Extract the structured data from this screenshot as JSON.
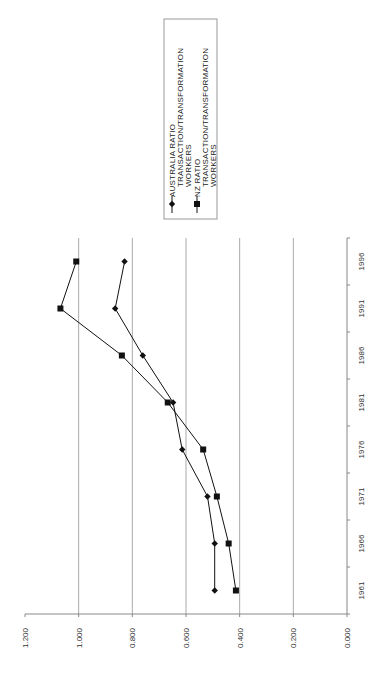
{
  "chart_data": {
    "type": "line",
    "orientation": "rotated-90-ccw",
    "title": "",
    "xlabel": "",
    "ylabel": "",
    "categories": [
      "1961",
      "1966",
      "1971",
      "1976",
      "1981",
      "1986",
      "1991",
      "1996"
    ],
    "series": [
      {
        "name": "AUSTRALIA RATIO TRANSACTION/TRANSFORMATION WORKERS",
        "legend_lines": [
          "AUSTRALIA RATIO",
          "TRANSACTION/TRANSFORMATION",
          "WORKERS"
        ],
        "marker": "diamond",
        "color": "#111111",
        "values": [
          0.493,
          0.493,
          0.52,
          0.614,
          0.648,
          0.761,
          0.864,
          0.829
        ]
      },
      {
        "name": "NZ RATIO TRANSACTION/TRANSFORMATION WORKERS",
        "legend_lines": [
          "NZ RATIO",
          "TRANSACTION/TRANSFORMATION",
          "WORKERS"
        ],
        "marker": "square",
        "color": "#111111",
        "values": [
          0.414,
          0.441,
          0.485,
          0.536,
          0.668,
          0.839,
          1.068,
          1.009
        ]
      }
    ],
    "ylim": [
      0,
      1.2
    ],
    "yticks": [
      "0.000",
      "0.200",
      "0.400",
      "0.600",
      "0.800",
      "1.000",
      "1.200"
    ],
    "grid": true,
    "legend_position": "right (top of rotated page)"
  }
}
